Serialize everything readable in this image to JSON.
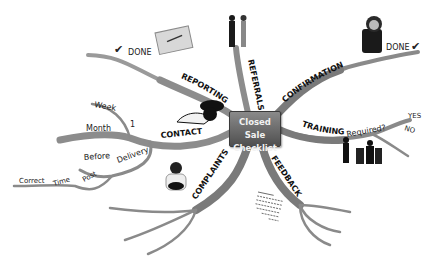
{
  "center": {
    "line1": "Closed Sale",
    "line2": "Checklist"
  },
  "branches": {
    "reporting": {
      "label": "REPORTING",
      "children": [
        "DONE"
      ],
      "check": "✔"
    },
    "referrals": {
      "label": "REFERRALS"
    },
    "confirmation": {
      "label": "CONFIRMATION",
      "children": [
        "DONE"
      ],
      "check": "✔"
    },
    "training": {
      "label": "TRAINING",
      "question": "Required?",
      "children": [
        "YES",
        "NO"
      ]
    },
    "feedback": {
      "label": "FEEDBACK"
    },
    "complaints": {
      "label": "COMPLAINTS"
    },
    "contact": {
      "label": "CONTACT",
      "number": "1",
      "children": [
        "Week",
        "Month"
      ],
      "delivery": {
        "label": "Delivery",
        "children": [
          "Before",
          "Post"
        ],
        "post_children": [
          "Time",
          "Correct"
        ]
      }
    }
  },
  "images": [
    "notebook-image",
    "handshake-people-image",
    "woman-on-phone-image",
    "telephone-image",
    "meeting-group-image",
    "sitting-child-image",
    "checklist-document-image"
  ],
  "colors": {
    "branch": "#8a8a8a",
    "branch_dark": "#6e6e6e",
    "center_top": "#8a8a8a",
    "center_bottom": "#4f4f4f"
  }
}
